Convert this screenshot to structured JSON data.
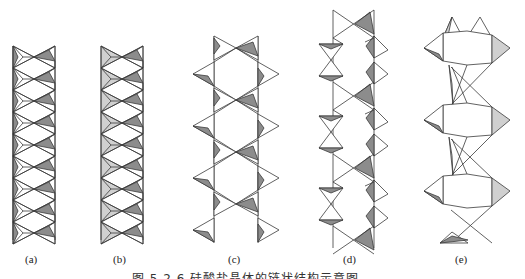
{
  "figure": {
    "panels": [
      {
        "id": "a",
        "label": "(a)",
        "label_x": 25
      },
      {
        "id": "b",
        "label": "(b)",
        "label_x": 113
      },
      {
        "id": "c",
        "label": "(c)",
        "label_x": 228
      },
      {
        "id": "d",
        "label": "(d)",
        "label_x": 343
      },
      {
        "id": "e",
        "label": "(e)",
        "label_x": 455
      }
    ],
    "caption": "图 5.2.6   硅酸盐晶体的链状结构示意图",
    "colors": {
      "stroke": "#3a3a3a",
      "dark_fill": "#8c8c8c",
      "light_fill": "#d0d0d0",
      "background": "#ffffff"
    }
  }
}
